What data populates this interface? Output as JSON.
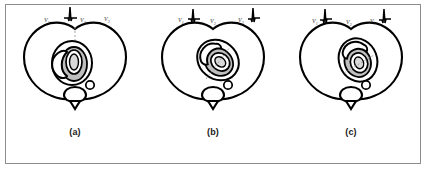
{
  "figure": {
    "background_color": "#ffffff",
    "frame_color": "#8d8d8d",
    "ink_color": "#000000",
    "shade_color": "#bfbfbf",
    "caption_below": ""
  },
  "panels": [
    {
      "id": "a",
      "caption": "(a)",
      "heart_rotation_deg": 0,
      "leads": [
        {
          "name": "V",
          "subscript": "1",
          "label": "V1",
          "has_ecg_trace": false
        },
        {
          "name": "V",
          "subscript": "2",
          "label": "V2",
          "has_ecg_trace": true
        },
        {
          "name": "V",
          "subscript": "3",
          "label": "V3",
          "has_ecg_trace": false
        }
      ]
    },
    {
      "id": "b",
      "caption": "(b)",
      "heart_rotation_deg": 40,
      "leads": [
        {
          "name": "V",
          "subscript": "1",
          "label": "V1",
          "has_ecg_trace": true
        },
        {
          "name": "V",
          "subscript": "2",
          "label": "V2",
          "has_ecg_trace": false
        },
        {
          "name": "V",
          "subscript": "3",
          "label": "V3",
          "has_ecg_trace": true
        }
      ]
    },
    {
      "id": "c",
      "caption": "(c)",
      "heart_rotation_deg": 70,
      "leads": [
        {
          "name": "V",
          "subscript": "1",
          "label": "V1",
          "has_ecg_trace": true
        },
        {
          "name": "V",
          "subscript": "2",
          "label": "V2",
          "has_ecg_trace": false
        },
        {
          "name": "V",
          "subscript": "3",
          "label": "V3",
          "has_ecg_trace": true
        }
      ]
    }
  ]
}
